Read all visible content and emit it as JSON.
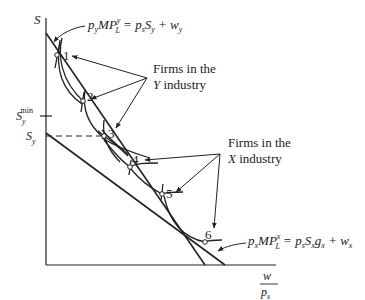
{
  "diagram": {
    "axes": {
      "y_label": "S",
      "x_label_num": "w",
      "x_label_den": "p",
      "x_label_den_sub": "s"
    },
    "y_ticks": {
      "smin_main": "S",
      "smin_sub": "y",
      "smin_sup": "min",
      "sy_main": "S",
      "sy_sub": "y"
    },
    "equations": {
      "y_industry": {
        "p": "p",
        "p_sub": "y",
        "mp": "MP",
        "mp_sup": "y",
        "mp_sub": "L",
        "rhs1": " = p",
        "rhs1_sub": "s",
        "rhs2": "S",
        "rhs2_sub": "y",
        "rhs3": " + w",
        "rhs3_sub": "y"
      },
      "x_industry": {
        "p": "p",
        "p_sub": "x",
        "mp": "MP",
        "mp_sup": "x",
        "mp_sub": "L",
        "rhs1": " = p",
        "rhs1_sub": "s",
        "rhs2": "S",
        "rhs2_sub": "x",
        "rhs3": "g",
        "rhs3_sub": "x",
        "rhs4": " + w",
        "rhs4_sub": "x"
      }
    },
    "annotations": {
      "y_firms_line1": "Firms in the",
      "y_firms_line2_italic": "Y",
      "y_firms_line2_rest": " industry",
      "x_firms_line1": "Firms in the",
      "x_firms_line2_italic": "X",
      "x_firms_line2_rest": " industry"
    },
    "points": [
      {
        "label": "1",
        "x": 57,
        "y": 55
      },
      {
        "label": "2",
        "x": 83,
        "y": 101
      },
      {
        "label": "3",
        "x": 104,
        "y": 136
      },
      {
        "label": "4",
        "x": 130,
        "y": 167
      },
      {
        "label": "5",
        "x": 162,
        "y": 194
      },
      {
        "label": "6",
        "x": 205,
        "y": 242
      }
    ]
  }
}
